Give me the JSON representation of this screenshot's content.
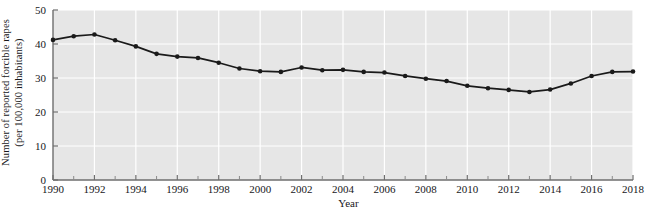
{
  "axes": {
    "y_title_line1": "Number of reported forcible rapes",
    "y_title_line2": "(per 100,000 inhabitants)",
    "x_title": "Year"
  },
  "chart_data": {
    "type": "line",
    "title": "",
    "xlabel": "Year",
    "ylabel": "Number of reported forcible rapes (per 100,000 inhabitants)",
    "xlim": [
      1990,
      2018
    ],
    "ylim": [
      0,
      50
    ],
    "ytick_labels": [
      "0",
      "10",
      "20",
      "30",
      "40",
      "50"
    ],
    "yticks": [
      0,
      10,
      20,
      30,
      40,
      50
    ],
    "xtick_labels": [
      "1990",
      "1992",
      "1994",
      "1996",
      "1998",
      "2000",
      "2002",
      "2004",
      "2006",
      "2008",
      "2010",
      "2012",
      "2014",
      "2016",
      "2018"
    ],
    "xticks_major": [
      1990,
      1992,
      1994,
      1996,
      1998,
      2000,
      2002,
      2004,
      2006,
      2008,
      2010,
      2012,
      2014,
      2016,
      2018
    ],
    "xticks_minor": [
      1991,
      1993,
      1995,
      1997,
      1999,
      2001,
      2003,
      2005,
      2007,
      2009,
      2011,
      2013,
      2015,
      2017
    ],
    "grid": true,
    "grid_color": "#ffffff",
    "plot_background": "#e6e6e6",
    "line_color": "#1a1a1a",
    "marker": "circle",
    "legend": null,
    "x": [
      1990,
      1991,
      1992,
      1993,
      1994,
      1995,
      1996,
      1997,
      1998,
      1999,
      2000,
      2001,
      2002,
      2003,
      2004,
      2005,
      2006,
      2007,
      2008,
      2009,
      2010,
      2011,
      2012,
      2013,
      2014,
      2015,
      2016,
      2017,
      2018
    ],
    "values": [
      41.2,
      42.3,
      42.8,
      41.1,
      39.3,
      37.1,
      36.3,
      35.9,
      34.5,
      32.8,
      32.0,
      31.8,
      33.1,
      32.3,
      32.4,
      31.8,
      31.6,
      30.6,
      29.8,
      29.1,
      27.7,
      27.0,
      26.5,
      25.9,
      26.6,
      28.4,
      30.6,
      31.8,
      31.9
    ],
    "annotations": []
  }
}
